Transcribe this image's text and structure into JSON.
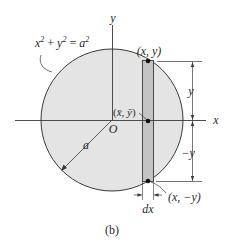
{
  "figure": {
    "caption": "(b)",
    "equation": {
      "base_x": "x",
      "exp_x": "2",
      "plus": " + ",
      "base_y": "y",
      "exp_y": "2",
      "equals": " = ",
      "base_a": "a",
      "exp_a": "2"
    },
    "axes": {
      "x_label": "x",
      "y_label": "y",
      "origin_label": "O"
    },
    "radius_label": "a",
    "points": {
      "top": "(x, y)",
      "bottom": "(x, −y)",
      "centroid_open": "(",
      "centroid_x": "x̄",
      "centroid_sep": ", ",
      "centroid_y": "ȳ",
      "centroid_close": ")"
    },
    "dimensions": {
      "upper": "y",
      "lower": "−y",
      "width": "dx"
    },
    "colors": {
      "disk_fill": "#e4e4e4",
      "strip_fill": "#c4c4c4",
      "stroke": "#3a3a3a",
      "background": "#ffffff"
    }
  }
}
